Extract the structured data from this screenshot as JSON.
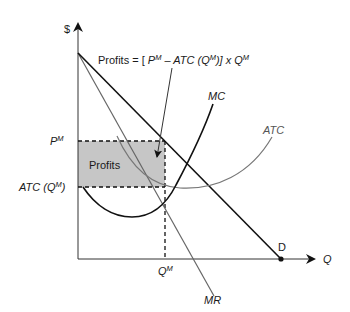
{
  "diagram": {
    "axes": {
      "y_label": "$",
      "x_label": "Q"
    },
    "curves": {
      "demand": {
        "label": "D",
        "color": "#111111"
      },
      "marginal_revenue": {
        "label": "MR",
        "color": "#666666"
      },
      "marginal_cost": {
        "label": "MC",
        "color": "#111111"
      },
      "average_total_cost": {
        "label": "ATC",
        "color": "#777777"
      }
    },
    "price_label": {
      "base": "P",
      "sup": "M"
    },
    "cost_label": {
      "prefix": "ATC (Q",
      "sup": "M",
      "suffix": ")"
    },
    "quantity_label": {
      "base": "Q",
      "sup": "M"
    },
    "profit_area": {
      "label": "Profits",
      "fill": "#c6c6c6"
    },
    "formula": {
      "part1": "Profits = [ ",
      "p": "P",
      "p_sup": "M",
      "part2": " – ATC (Q",
      "q_sup": "M",
      "part3": ")] x Q",
      "q2_sup": "M"
    }
  }
}
